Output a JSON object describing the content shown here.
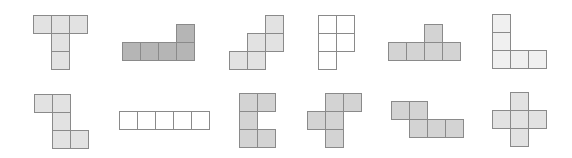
{
  "diagram": {
    "title": "",
    "cell_size": 18,
    "colors": {
      "light": "#e2e2e2",
      "medium": "#d3d3d3",
      "dark": "#b5b5b5",
      "pale": "#f0f0f0",
      "white": "#ffffff",
      "border": "#8a8a8a"
    },
    "shapes": [
      {
        "id": "t-shape",
        "x": 33,
        "y": 15,
        "fill": "light",
        "cells": [
          [
            0,
            0
          ],
          [
            1,
            0
          ],
          [
            2,
            0
          ],
          [
            1,
            1
          ],
          [
            1,
            2
          ]
        ]
      },
      {
        "id": "l-four-row",
        "x": 122,
        "y": 24,
        "fill": "dark",
        "cells": [
          [
            3,
            0
          ],
          [
            0,
            1
          ],
          [
            1,
            1
          ],
          [
            2,
            1
          ],
          [
            3,
            1
          ]
        ]
      },
      {
        "id": "staircase",
        "x": 229,
        "y": 15,
        "fill": "light",
        "cells": [
          [
            2,
            0
          ],
          [
            1,
            1
          ],
          [
            2,
            1
          ],
          [
            0,
            2
          ],
          [
            1,
            2
          ]
        ]
      },
      {
        "id": "p-shape-white",
        "x": 318,
        "y": 15,
        "fill": "white",
        "cells": [
          [
            0,
            0
          ],
          [
            1,
            0
          ],
          [
            0,
            1
          ],
          [
            1,
            1
          ],
          [
            0,
            2
          ]
        ]
      },
      {
        "id": "t-four-row",
        "x": 388,
        "y": 24,
        "fill": "medium",
        "cells": [
          [
            2,
            0
          ],
          [
            0,
            1
          ],
          [
            1,
            1
          ],
          [
            2,
            1
          ],
          [
            3,
            1
          ]
        ]
      },
      {
        "id": "l-corner",
        "x": 492,
        "y": 14,
        "fill": "pale",
        "cells": [
          [
            0,
            0
          ],
          [
            0,
            1
          ],
          [
            0,
            2
          ],
          [
            1,
            2
          ],
          [
            2,
            2
          ]
        ]
      },
      {
        "id": "s-vertical",
        "x": 34,
        "y": 94,
        "fill": "light",
        "cells": [
          [
            0,
            0
          ],
          [
            1,
            0
          ],
          [
            1,
            1
          ],
          [
            1,
            2
          ],
          [
            2,
            2
          ]
        ]
      },
      {
        "id": "i-five-row",
        "x": 119,
        "y": 111,
        "fill": "white",
        "cells": [
          [
            0,
            0
          ],
          [
            1,
            0
          ],
          [
            2,
            0
          ],
          [
            3,
            0
          ],
          [
            4,
            0
          ]
        ]
      },
      {
        "id": "c-shape",
        "x": 239,
        "y": 93,
        "fill": "medium",
        "cells": [
          [
            0,
            0
          ],
          [
            1,
            0
          ],
          [
            0,
            1
          ],
          [
            0,
            2
          ],
          [
            1,
            2
          ]
        ]
      },
      {
        "id": "f-shape",
        "x": 307,
        "y": 93,
        "fill": "medium",
        "cells": [
          [
            1,
            0
          ],
          [
            2,
            0
          ],
          [
            0,
            1
          ],
          [
            1,
            1
          ],
          [
            1,
            2
          ]
        ]
      },
      {
        "id": "n-shape",
        "x": 391,
        "y": 101,
        "fill": "medium",
        "cells": [
          [
            0,
            0
          ],
          [
            1,
            0
          ],
          [
            1,
            1
          ],
          [
            2,
            1
          ],
          [
            3,
            1
          ]
        ]
      },
      {
        "id": "plus-shape",
        "x": 492,
        "y": 92,
        "fill": "light",
        "cells": [
          [
            1,
            0
          ],
          [
            0,
            1
          ],
          [
            1,
            1
          ],
          [
            2,
            1
          ],
          [
            1,
            2
          ]
        ]
      }
    ]
  }
}
